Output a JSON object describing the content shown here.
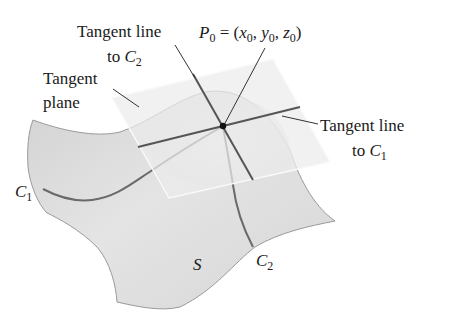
{
  "figure": {
    "labels": {
      "tangent_line_c2": {
        "line1": "Tangent line",
        "line2_prefix": "to ",
        "curve": "C",
        "curve_sub": "2"
      },
      "point": {
        "name": "P",
        "name_sub": "0",
        "eq": " = (",
        "x": "x",
        "x_sub": "0",
        "sep1": ", ",
        "y": "y",
        "y_sub": "0",
        "sep2": ", ",
        "z": "z",
        "z_sub": "0",
        "close": ")"
      },
      "tangent_plane": {
        "line1": "Tangent",
        "line2": "plane"
      },
      "tangent_line_c1": {
        "line1": "Tangent line",
        "line2_prefix": "to ",
        "curve": "C",
        "curve_sub": "1"
      },
      "curve_c1": {
        "name": "C",
        "sub": "1"
      },
      "curve_c2": {
        "name": "C",
        "sub": "2"
      },
      "surface": {
        "name": "S"
      }
    },
    "colors": {
      "surface_fill": "#dcdcdc",
      "surface_edge": "#9a9a9a",
      "plane_fill": "#e9e9e9",
      "plane_edge": "#f6f6f6",
      "line": "#555555",
      "leader": "#333333",
      "point": "#111111",
      "text": "#1a1a1a"
    }
  }
}
